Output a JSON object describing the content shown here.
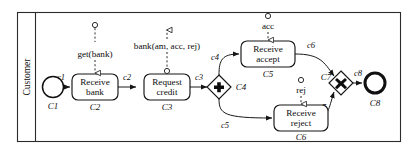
{
  "diagram": {
    "notation": "BPMN",
    "pool": {
      "lane_label": "Customer"
    },
    "colors": {
      "stroke": "#151515",
      "background": "#ffffff",
      "message_stroke": "#2a2a2a"
    },
    "events": [
      {
        "id": "C1",
        "label": "",
        "type": "start-event",
        "id_label": "C1"
      },
      {
        "id": "C8",
        "label": "",
        "type": "end-event",
        "id_label": "C8"
      }
    ],
    "tasks": [
      {
        "id": "C2",
        "line1": "Receive",
        "line2": "bank",
        "id_label": "C2"
      },
      {
        "id": "C3",
        "line1": "Request",
        "line2": "credit",
        "id_label": "C3"
      },
      {
        "id": "C5",
        "line1": "Receive",
        "line2": "accept",
        "id_label": "C5"
      },
      {
        "id": "C6",
        "line1": "Receive",
        "line2": "reject",
        "id_label": "C6"
      }
    ],
    "gateways": [
      {
        "id": "C4",
        "type": "parallel-and",
        "glyph": "plus",
        "id_label": "C4"
      },
      {
        "id": "C7",
        "type": "exclusive-xor",
        "glyph": "cross",
        "id_label": "C7"
      }
    ],
    "flows": [
      {
        "id": "c1",
        "label": "c1",
        "from": "C1",
        "to": "C2"
      },
      {
        "id": "c2",
        "label": "c2",
        "from": "C2",
        "to": "C3"
      },
      {
        "id": "c3",
        "label": "c3",
        "from": "C3",
        "to": "C4"
      },
      {
        "id": "c4",
        "label": "c4",
        "from": "C4",
        "to": "C5"
      },
      {
        "id": "c5",
        "label": "c5",
        "from": "C4",
        "to": "C6"
      },
      {
        "id": "c6",
        "label": "c6",
        "from": "C5",
        "to": "C7"
      },
      {
        "id": "c7",
        "label": "c7",
        "from": "C6",
        "to": "C7"
      },
      {
        "id": "c8",
        "label": "c8",
        "from": "C7",
        "to": "C8"
      }
    ],
    "messages": [
      {
        "id": "m1",
        "label": "get(bank)",
        "direction": "incoming",
        "attached_to": "C2"
      },
      {
        "id": "m2",
        "label": "bank(am, acc, rej)",
        "direction": "outgoing",
        "attached_to": "C3"
      },
      {
        "id": "m3",
        "label": "acc",
        "direction": "incoming",
        "attached_to": "C5"
      },
      {
        "id": "m4",
        "label": "rej",
        "direction": "incoming",
        "attached_to": "C6"
      }
    ]
  }
}
